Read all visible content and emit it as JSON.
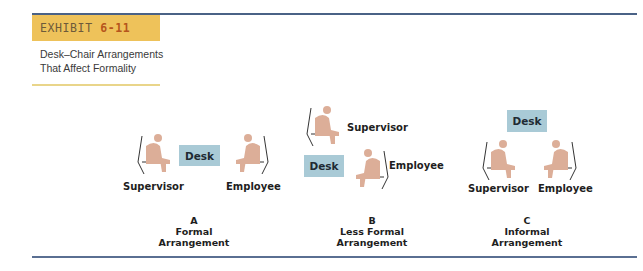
{
  "exhibit": {
    "label": "EXHIBIT",
    "number": "6-11",
    "caption_line1": "Desk–Chair Arrangements",
    "caption_line2": "That Affect Formality"
  },
  "colors": {
    "header_bar": "#eec25a",
    "exhibit_number": "#b6551c",
    "desk": "#a9cad6",
    "person": "#dcae98",
    "rule": "#4a6286"
  },
  "arrangements": [
    {
      "letter": "A",
      "line1": "Formal",
      "line2": "Arrangement",
      "desk_label": "Desk",
      "supervisor_label": "Supervisor",
      "employee_label": "Employee"
    },
    {
      "letter": "B",
      "line1": "Less Formal",
      "line2": "Arrangement",
      "desk_label": "Desk",
      "supervisor_label": "Supervisor",
      "employee_label": "Employee"
    },
    {
      "letter": "C",
      "line1": "Informal",
      "line2": "Arrangement",
      "desk_label": "Desk",
      "supervisor_label": "Supervisor",
      "employee_label": "Employee"
    }
  ]
}
